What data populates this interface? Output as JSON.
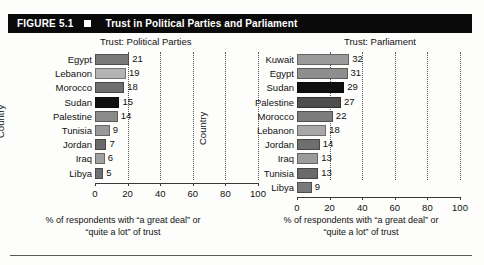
{
  "header": {
    "figure_number": "FIGURE 5.1",
    "marker_icon": "black-square-icon",
    "title": "Trust in Political Parties and Parliament",
    "background_color": "#0a0a0a",
    "text_color": "#ffffff"
  },
  "axis": {
    "tick_labels": [
      "0",
      "20",
      "40",
      "60",
      "80",
      "100"
    ],
    "ylabel": "Country",
    "caption_line1": "% of respondents with “a great deal” or",
    "caption_line2": "“quite a lot” of trust"
  },
  "chart_data": [
    {
      "type": "bar",
      "title": "Trust: Political Parties",
      "orientation": "horizontal",
      "xlabel": "% of respondents with “a great deal” or “quite a lot” of trust",
      "ylabel": "Country",
      "xlim": [
        0,
        100
      ],
      "xticks": [
        0,
        20,
        40,
        60,
        80,
        100
      ],
      "grid": true,
      "legend": "none",
      "categories": [
        "Egypt",
        "Lebanon",
        "Morocco",
        "Sudan",
        "Palestine",
        "Tunisia",
        "Jordan",
        "Iraq",
        "Libya"
      ],
      "values": [
        21,
        19,
        18,
        15,
        14,
        9,
        7,
        6,
        5
      ],
      "bar_colors": [
        "#787878",
        "#b4b4b4",
        "#6e6e6e",
        "#111111",
        "#8a8a8a",
        "#999999",
        "#6a6a6a",
        "#a0a0a0",
        "#707070"
      ]
    },
    {
      "type": "bar",
      "title": "Trust: Parliament",
      "orientation": "horizontal",
      "xlabel": "% of respondents with “a great deal” or “quite a lot” of trust",
      "ylabel": "Country",
      "xlim": [
        0,
        100
      ],
      "xticks": [
        0,
        20,
        40,
        60,
        80,
        100
      ],
      "grid": true,
      "legend": "none",
      "categories": [
        "Kuwait",
        "Egypt",
        "Sudan",
        "Palestine",
        "Morocco",
        "Lebanon",
        "Jordan",
        "Iraq",
        "Tunisia",
        "Libya"
      ],
      "values": [
        32,
        31,
        29,
        27,
        22,
        18,
        14,
        13,
        13,
        9
      ],
      "bar_colors": [
        "#9a9a9a",
        "#8e8e8e",
        "#0f0f0f",
        "#4e4e4e",
        "#7c7c7c",
        "#a8a8a8",
        "#6e6e6e",
        "#9c9c9c",
        "#6a6a6a",
        "#7a7a7a"
      ]
    }
  ]
}
